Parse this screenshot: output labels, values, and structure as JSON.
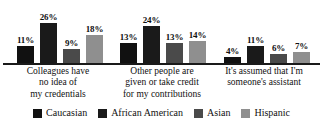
{
  "chart_data": {
    "type": "bar",
    "title": "",
    "subtitle": "",
    "xlabel": "",
    "ylabel": "",
    "ylim": [
      0,
      30
    ],
    "grid": false,
    "legend_position": "bottom",
    "value_suffix": "%",
    "categories": [
      "Colleagues have no idea of my credentials",
      "Other people are given or take credit for my contributions",
      "It's assumed that I'm someone's assistant"
    ],
    "category_lines": [
      [
        "Colleagues have",
        "no idea of",
        "my credentials"
      ],
      [
        "Other people are",
        "given or take credit",
        "for my contributions"
      ],
      [
        "It's assumed that I'm",
        "someone's assistant"
      ]
    ],
    "series": [
      {
        "name": "Caucasian",
        "color": "#111111",
        "values": [
          11,
          13,
          4
        ],
        "labels": [
          "11%",
          "13%",
          "4%"
        ]
      },
      {
        "name": "African American",
        "color": "#1a1a1a",
        "values": [
          26,
          24,
          11
        ],
        "labels": [
          "26%",
          "24%",
          "11%"
        ]
      },
      {
        "name": "Asian",
        "color": "#4a4a4a",
        "values": [
          9,
          13,
          6
        ],
        "labels": [
          "9%",
          "13%",
          "6%"
        ]
      },
      {
        "name": "Hispanic",
        "color": "#8f8f8f",
        "values": [
          18,
          14,
          7
        ],
        "labels": [
          "18%",
          "14%",
          "7%"
        ]
      }
    ]
  },
  "legend": {
    "items": [
      {
        "label": "Caucasian",
        "color": "#111111"
      },
      {
        "label": "African American",
        "color": "#1a1a1a"
      },
      {
        "label": "Asian",
        "color": "#4a4a4a"
      },
      {
        "label": "Hispanic",
        "color": "#8f8f8f"
      }
    ]
  },
  "axis": {
    "baseline_color": "#1a1a1a"
  }
}
